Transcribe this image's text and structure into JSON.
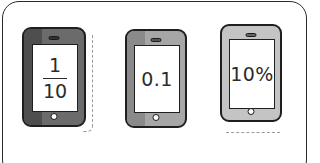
{
  "cards": [
    {
      "id": "phone-fraction",
      "display_type": "fraction",
      "numerator": "1",
      "denominator": "10",
      "body_color": "#6b6b6b",
      "strip_color": "#4e4e4e"
    },
    {
      "id": "phone-decimal",
      "display_type": "decimal",
      "value": "0.1",
      "body_color": "#a6a6a6",
      "strip_color": "#8a8a8a"
    },
    {
      "id": "phone-percent",
      "display_type": "percent",
      "value": "10%",
      "body_color": "#c4c4c4"
    }
  ],
  "icons": {
    "phone": "smartphone-icon",
    "speaker": "speaker-slot",
    "home": "home-button"
  }
}
